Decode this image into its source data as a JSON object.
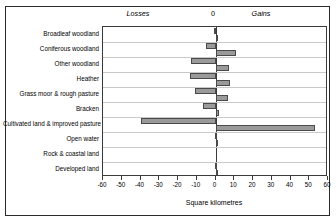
{
  "chart_data": {
    "type": "bar",
    "orientation": "horizontal",
    "title": "",
    "xlabel": "Square kilometres",
    "ylabel": "",
    "xlim": [
      -60,
      60
    ],
    "xticks": [
      -60,
      -50,
      -40,
      -30,
      -20,
      -10,
      0,
      10,
      20,
      30,
      40,
      50,
      60
    ],
    "xticklabels": [
      "-60",
      "-50",
      "-40",
      "-30",
      "-20",
      "-10",
      "0",
      "10",
      "20",
      "30",
      "40",
      "50",
      "60"
    ],
    "grid": "horizontal-band-separators",
    "legend": "none",
    "annotations": [
      {
        "text": "Losses",
        "position": "top-left-of-zero",
        "style": "italic"
      },
      {
        "text": "0",
        "position": "top-at-zero",
        "style": "normal"
      },
      {
        "text": "Gains",
        "position": "top-right-of-zero",
        "style": "italic"
      }
    ],
    "categories": [
      "Broadleaf woodland",
      "Coniferous woodland",
      "Other woodland",
      "Heather",
      "Grass moor & rough pasture",
      "Bracken",
      "Cultivated land & improved pasture",
      "Open water",
      "Rock & coastal land",
      "Developed land"
    ],
    "series": [
      {
        "name": "Losses",
        "values": [
          -1.0,
          -5.0,
          -13.0,
          -13.5,
          -11.0,
          -6.5,
          -40.0,
          -0.3,
          0.0,
          -0.2
        ]
      },
      {
        "name": "Gains",
        "values": [
          1.0,
          11.0,
          7.0,
          7.5,
          6.5,
          2.0,
          53.0,
          1.5,
          0.0,
          0.4
        ]
      }
    ],
    "colors": {
      "bar_fill": "#9a9a9a",
      "bar_border": "#4a4a4a",
      "axis": "#3a3a3a",
      "band_separator": "#c9c9c9",
      "frame": "#2b2b2b",
      "background": "#ffffff",
      "text": "#000000"
    }
  }
}
